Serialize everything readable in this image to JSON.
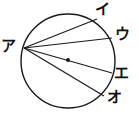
{
  "figure": {
    "background_color": "#ffffff",
    "stroke_color": "#1a1a1a",
    "width": 139,
    "height": 116,
    "circle": {
      "cx": 68,
      "cy": 61,
      "r": 47,
      "stroke_width": 1.4
    },
    "center_dot": {
      "cx": 68,
      "cy": 60,
      "r": 1.9
    },
    "vertex": {
      "name": "ア",
      "x": 24,
      "y": 48
    },
    "chords": [
      {
        "from": "ア",
        "to": "イ",
        "x1": 24,
        "y1": 48,
        "x2": 97,
        "y2": 19
      },
      {
        "from": "ア",
        "to": "ウ",
        "x1": 24,
        "y1": 48,
        "x2": 112,
        "y2": 38
      },
      {
        "from": "ア",
        "to": "エ",
        "x1": 24,
        "y1": 48,
        "x2": 112,
        "y2": 73
      },
      {
        "from": "ア",
        "to": "オ",
        "x1": 24,
        "y1": 48,
        "x2": 104,
        "y2": 96
      }
    ],
    "labels": {
      "a": "ア",
      "i": "イ",
      "u": "ウ",
      "e": "エ",
      "o": "オ"
    }
  }
}
